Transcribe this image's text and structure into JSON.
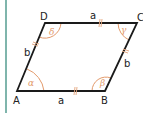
{
  "figure": {
    "type": "parallelogram",
    "vertices": {
      "A": "A",
      "B": "B",
      "C": "C",
      "D": "D"
    },
    "sides": {
      "AB": "a",
      "DC": "a",
      "AD": "b",
      "BC": "b"
    },
    "angles": {
      "A": "α",
      "B": "β",
      "C": "γ",
      "D": "δ"
    },
    "colors": {
      "edge": "#1a1a1a",
      "angle": "#e39a6b",
      "tick": "#e3a47a",
      "border": "#7fb5ac"
    }
  }
}
